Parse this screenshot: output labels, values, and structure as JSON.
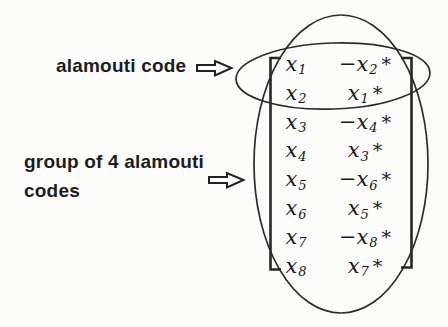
{
  "labels": {
    "alamouti_code": "alamouti code",
    "group_of_codes": "group of 4 alamouti codes"
  },
  "icons": {
    "arrow_to_alamouti_code": "right-arrow",
    "arrow_to_group": "right-arrow"
  },
  "colors": {
    "ink": "#1c1c1c",
    "shape_stroke": "#2c2c2c",
    "background": "#fcfcfa"
  },
  "matrix": {
    "columns": 2,
    "rows": [
      {
        "c1": "x",
        "c1sub": "1",
        "c2": "−x",
        "c2sub": "2",
        "star": "*"
      },
      {
        "c1": "x",
        "c1sub": "2",
        "c2": "x",
        "c2sub": "1",
        "star": "*"
      },
      {
        "c1": "x",
        "c1sub": "3",
        "c2": "−x",
        "c2sub": "4",
        "star": "*"
      },
      {
        "c1": "x",
        "c1sub": "4",
        "c2": "x",
        "c2sub": "3",
        "star": "*"
      },
      {
        "c1": "x",
        "c1sub": "5",
        "c2": "−x",
        "c2sub": "6",
        "star": "*"
      },
      {
        "c1": "x",
        "c1sub": "6",
        "c2": "x",
        "c2sub": "5",
        "star": "*"
      },
      {
        "c1": "x",
        "c1sub": "7",
        "c2": "−x",
        "c2sub": "8",
        "star": "*"
      },
      {
        "c1": "x",
        "c1sub": "8",
        "c2": "x",
        "c2sub": "7",
        "star": "*"
      }
    ]
  }
}
